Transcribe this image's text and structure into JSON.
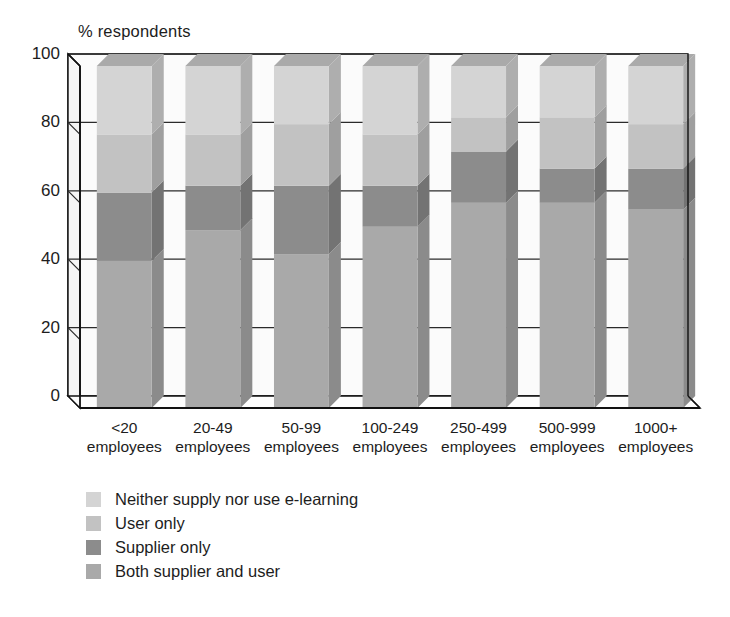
{
  "chart_data": {
    "type": "bar",
    "subtype": "stacked-3d-column",
    "title": "",
    "ylabel": "% respondents",
    "xlabel": "",
    "ylim": [
      0,
      100
    ],
    "yticks": [
      0,
      20,
      40,
      60,
      80,
      100
    ],
    "grid": true,
    "legend_position": "bottom-left",
    "stacked_total": 100,
    "categories": [
      "<20 employees",
      "20-49 employees",
      "50-99 employees",
      "100-249 employees",
      "250-499 employees",
      "500-999 employees",
      "1000+ employees"
    ],
    "category_lines": [
      [
        "<20",
        "employees"
      ],
      [
        "20-49",
        "employees"
      ],
      [
        "50-99",
        "employees"
      ],
      [
        "100-249",
        "employees"
      ],
      [
        "250-499",
        "employees"
      ],
      [
        "500-999",
        "employees"
      ],
      [
        "1000+",
        "employees"
      ]
    ],
    "series": [
      {
        "name": "Both supplier and user",
        "color": "#a9a9a9",
        "values": [
          43,
          52,
          45,
          53,
          60,
          60,
          58
        ]
      },
      {
        "name": "Supplier only",
        "color": "#8c8c8c",
        "values": [
          20,
          13,
          20,
          12,
          15,
          10,
          12
        ]
      },
      {
        "name": "User only",
        "color": "#c2c2c2",
        "values": [
          17,
          15,
          18,
          15,
          10,
          15,
          13
        ]
      },
      {
        "name": "Neither supply nor use e-learning",
        "color": "#d4d4d4",
        "values": [
          20,
          20,
          17,
          20,
          15,
          15,
          17
        ]
      }
    ]
  },
  "axis": {
    "y_title": "% respondents",
    "y_tick_labels": [
      "100",
      "80",
      "60",
      "40",
      "20",
      "0"
    ]
  },
  "legend": {
    "items": [
      {
        "label": "Neither supply nor use e-learning",
        "color": "#d4d4d4"
      },
      {
        "label": "User only",
        "color": "#c2c2c2"
      },
      {
        "label": "Supplier only",
        "color": "#8c8c8c"
      },
      {
        "label": "Both supplier and user",
        "color": "#a9a9a9"
      }
    ]
  },
  "colors": {
    "axis_line": "#111111",
    "grid_line": "#2b2b2b",
    "background": "#ffffff",
    "side_shade": "#8f8f8f",
    "top_shade": "#b5b5b5"
  }
}
